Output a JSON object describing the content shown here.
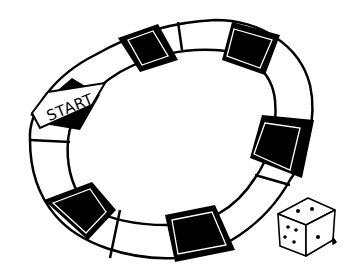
{
  "illustration": {
    "subject": "board-game-track",
    "start_label": "START",
    "colors": {
      "ink": "#000000",
      "paper": "#ffffff"
    },
    "track": {
      "shape": "closed-oval-loop",
      "dark_spaces": 7,
      "light_spaces": 8
    },
    "die": {
      "faces_visible": {
        "top": 2,
        "left": 5,
        "right": 1
      }
    }
  }
}
